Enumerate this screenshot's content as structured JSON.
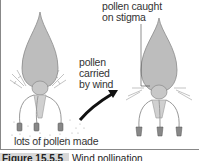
{
  "diagram": {
    "labels": {
      "pollen_caught": [
        "pollen caught",
        "on stigma"
      ],
      "pollen_carried": [
        "pollen",
        "carried",
        "by wind"
      ],
      "pollen_made": "lots of pollen made"
    },
    "caption": {
      "figure_number": "Figure 15.5.5",
      "title": "Wind pollination"
    },
    "colors": {
      "flower_fill": "#bdbdbd",
      "flower_stroke": "#8a8a8a",
      "arrow": "#111111",
      "text": "#333333"
    }
  }
}
